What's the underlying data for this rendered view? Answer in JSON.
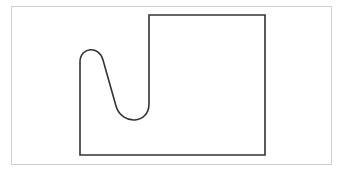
{
  "diagram": {
    "frame_color": "#cfcfcf",
    "stroke_color": "#333333",
    "shape": "outline-with-curved-notch"
  }
}
